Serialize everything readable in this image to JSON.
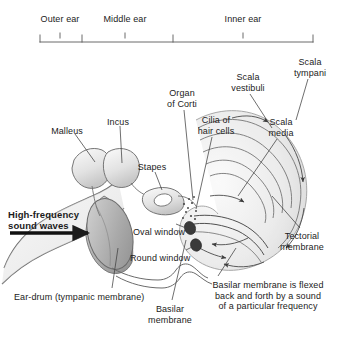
{
  "figure": {
    "background_color": "#ffffff",
    "text_color": "#1b1b1b",
    "line_color": "#4a4a4a"
  },
  "scale_bar": {
    "regions": [
      {
        "label": "Outer ear",
        "x_center": 60,
        "start": 40,
        "end": 82
      },
      {
        "label": "Middle ear",
        "x_center": 125,
        "start": 82,
        "end": 173
      },
      {
        "label": "Inner ear",
        "x_center": 243,
        "start": 173,
        "end": 313
      }
    ],
    "baseline_y": 42
  },
  "labels": [
    {
      "name": "scala-tympani",
      "text": "Scala\ntympani",
      "x": 310,
      "y": 57,
      "align": "center"
    },
    {
      "name": "scala-vestibuli",
      "text": "Scala\nvestibuli",
      "x": 248,
      "y": 72,
      "align": "center"
    },
    {
      "name": "organ-of-corti",
      "text": "Organ\nof Corti",
      "x": 182,
      "y": 88,
      "align": "center"
    },
    {
      "name": "cilia-of-hair-cells",
      "text": "Cilia of\nhair cells",
      "x": 216,
      "y": 115,
      "align": "center"
    },
    {
      "name": "scala-media",
      "text": "Scala\nmedia",
      "x": 281,
      "y": 117,
      "align": "center"
    },
    {
      "name": "malleus",
      "text": "Malleus",
      "x": 67,
      "y": 126,
      "align": "center"
    },
    {
      "name": "incus",
      "text": "Incus",
      "x": 118,
      "y": 117,
      "align": "center"
    },
    {
      "name": "stapes",
      "text": "Stapes",
      "x": 152,
      "y": 162,
      "align": "center"
    },
    {
      "name": "high-frequency-sound-waves",
      "text": "High-frequency\nsound waves",
      "x": 8,
      "y": 209,
      "align": "left"
    },
    {
      "name": "oval-window",
      "text": "Oval window",
      "x": 133,
      "y": 227,
      "align": "left"
    },
    {
      "name": "round-window",
      "text": "Round window",
      "x": 130,
      "y": 253,
      "align": "left"
    },
    {
      "name": "tectorial-membrane",
      "text": "Tectorial\nmembrane",
      "x": 302,
      "y": 231,
      "align": "center"
    },
    {
      "name": "ear-drum",
      "text": "Ear-drum (tympanic membrane)",
      "x": 14,
      "y": 292,
      "align": "left"
    },
    {
      "name": "basilar-membrane",
      "text": "Basilar\nmembrane",
      "x": 170,
      "y": 304,
      "align": "center"
    },
    {
      "name": "basilar-membrane-caption",
      "text": "Basilar membrane is flexed\nback and forth by a sound\nof a particular frequency",
      "x": 268,
      "y": 280,
      "align": "center"
    }
  ],
  "anatomy_parts": [
    "pinna-outer-ear",
    "ear-canal",
    "tympanic-membrane",
    "malleus-bone",
    "incus-bone",
    "stapes-bone",
    "oval-window-opening",
    "round-window-opening",
    "cochlea-spiral",
    "basilar-membrane-structure",
    "eustachian-tube"
  ]
}
